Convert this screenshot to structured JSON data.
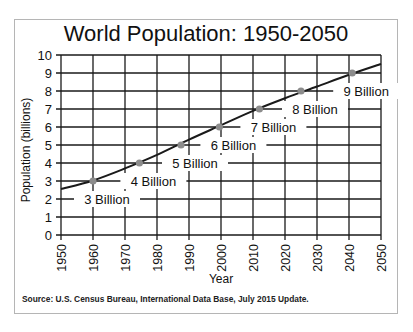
{
  "chart_data": {
    "type": "line",
    "title": "World Population: 1950-2050",
    "xlabel": "Year",
    "ylabel": "Population (billions)",
    "xlim": [
      1950,
      2050
    ],
    "ylim": [
      0,
      10
    ],
    "grid": true,
    "x_ticks": [
      "1950",
      "1960",
      "1970",
      "1980",
      "1990",
      "2000",
      "2010",
      "2020",
      "2030",
      "2040",
      "2050"
    ],
    "y_ticks": [
      "0",
      "1",
      "2",
      "3",
      "4",
      "5",
      "6",
      "7",
      "8",
      "9",
      "10"
    ],
    "series": [
      {
        "name": "World Population",
        "x": [
          1950,
          1960,
          1970,
          1980,
          1990,
          2000,
          2010,
          2020,
          2030,
          2040,
          2050
        ],
        "y": [
          2.55,
          3.03,
          3.7,
          4.45,
          5.3,
          6.1,
          6.9,
          7.6,
          8.25,
          8.9,
          9.5
        ]
      }
    ],
    "milestones": [
      {
        "label": "3 Billion",
        "year": 1960,
        "value": 3
      },
      {
        "label": "4 Billion",
        "year": 1974.5,
        "value": 4
      },
      {
        "label": "5 Billion",
        "year": 1987.5,
        "value": 5
      },
      {
        "label": "6 Billion",
        "year": 1999.5,
        "value": 6
      },
      {
        "label": "7 Billion",
        "year": 2012,
        "value": 7
      },
      {
        "label": "8 Billion",
        "year": 2025,
        "value": 8
      },
      {
        "label": "9 Billion",
        "year": 2041,
        "value": 9
      }
    ],
    "source": "Source: U.S. Census Bureau, International Data Base, July 2015 Update."
  },
  "colors": {
    "line": "#1a1a1a",
    "grid": "#1a1a1a",
    "marker": "#8c8c8c",
    "frame": "#b5b5b5"
  }
}
